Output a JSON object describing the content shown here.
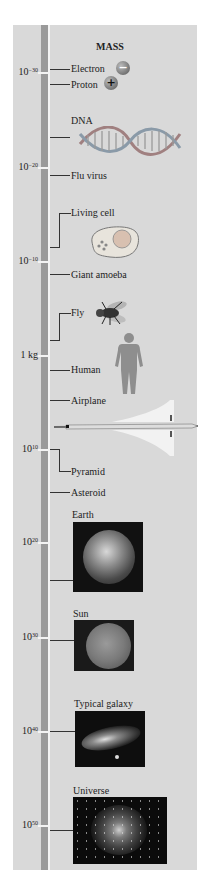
{
  "title": "MASS",
  "scale": [
    {
      "base": "10",
      "exp": "−30",
      "y": 72
    },
    {
      "base": "10",
      "exp": "−20",
      "y": 167
    },
    {
      "base": "10",
      "exp": "−10",
      "y": 261
    },
    {
      "base": "1 kg",
      "exp": "",
      "y": 355
    },
    {
      "base": "10",
      "exp": "10",
      "y": 449
    },
    {
      "base": "10",
      "exp": "20",
      "y": 542
    },
    {
      "base": "10",
      "exp": "30",
      "y": 637
    },
    {
      "base": "10",
      "exp": "40",
      "y": 731
    },
    {
      "base": "10",
      "exp": "50",
      "y": 825
    }
  ],
  "items": [
    {
      "label": "Electron"
    },
    {
      "label": "Proton"
    },
    {
      "label": "DNA"
    },
    {
      "label": "Flu virus"
    },
    {
      "label": "Living cell"
    },
    {
      "label": "Giant amoeba"
    },
    {
      "label": "Fly"
    },
    {
      "label": "Human"
    },
    {
      "label": "Airplane"
    },
    {
      "label": "Pyramid"
    },
    {
      "label": "Asteroid"
    },
    {
      "label": "Earth"
    },
    {
      "label": "Sun"
    },
    {
      "label": "Typical galaxy"
    },
    {
      "label": "Universe"
    }
  ],
  "icons": {
    "electron": "−",
    "proton": "+"
  },
  "colors": {
    "panel": "#d9d9d9",
    "ruler": "#9a9a9a",
    "ruler_line": "#f3f3f3"
  }
}
